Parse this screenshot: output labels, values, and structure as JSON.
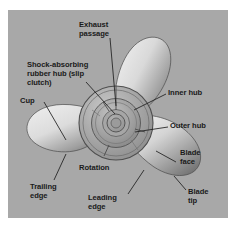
{
  "figure": {
    "panel_background": "#a8a8a8",
    "page_background": "#ffffff",
    "label_color": "#1a1a1a",
    "blade_light": "#e8e8e8",
    "blade_dark": "#6f6f6f",
    "hub_color": "#9a9a9a",
    "line_color": "#262626"
  },
  "labels": {
    "exhaust_passage": "Exhaust\npassage",
    "shock_absorbing_hub": "Shock-absorbing\nrubber hub (slip\nclutch)",
    "cup": "Cup",
    "inner_hub": "Inner hub",
    "outer_hub": "Outer hub",
    "blade_face": "Blade\nface",
    "blade_tip": "Blade\ntip",
    "rotation": "Rotation",
    "trailing_edge": "Trailing\nedge",
    "leading_edge": "Leading\nedge"
  },
  "parts": {
    "blade_upper": "upper-blade",
    "blade_left": "left-blade",
    "blade_lower_right": "lower-right-blade",
    "hub_outer_ring": "outer-hub-ring",
    "hub_inner_ring": "inner-hub-ring",
    "hub_bore": "hub-center-bore"
  }
}
